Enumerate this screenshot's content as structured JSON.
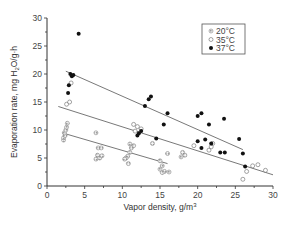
{
  "chart_data": {
    "type": "scatter",
    "title": "",
    "xlabel": "Vapor density, g/m³",
    "ylabel": "Evaporation rate, mg H₂O/g·h",
    "xlim": [
      0,
      30
    ],
    "ylim": [
      0,
      30
    ],
    "xticks": [
      0,
      5,
      10,
      15,
      20,
      25,
      30
    ],
    "yticks": [
      0,
      5,
      10,
      15,
      20,
      25,
      30
    ],
    "grid": false,
    "legend_position": "upper right",
    "series": [
      {
        "name": "20°C",
        "marker": "dotted-circle",
        "points": [
          [
            2.2,
            8.2
          ],
          [
            2.2,
            8.6
          ],
          [
            2.4,
            9
          ],
          [
            2.3,
            9.5
          ],
          [
            2.5,
            10
          ],
          [
            2.6,
            10.5
          ],
          [
            2.7,
            11.2
          ],
          [
            6.5,
            9.5
          ],
          [
            6.8,
            6.8
          ],
          [
            7.2,
            6.8
          ],
          [
            6.7,
            5.5
          ],
          [
            7,
            5
          ],
          [
            7.3,
            5.4
          ],
          [
            6.5,
            4.8
          ],
          [
            11,
            7.5
          ],
          [
            11.5,
            7.2
          ],
          [
            11.2,
            6.8
          ],
          [
            11,
            6
          ],
          [
            10.7,
            5.3
          ],
          [
            10.5,
            5
          ],
          [
            10.3,
            4.8
          ],
          [
            10.8,
            4
          ],
          [
            15,
            4.5
          ],
          [
            15.3,
            3.6
          ],
          [
            15,
            3
          ],
          [
            15.6,
            2.6
          ],
          [
            16.2,
            2.5
          ],
          [
            15.3,
            2.4
          ],
          [
            18,
            6
          ],
          [
            18.3,
            5.5
          ],
          [
            17.8,
            5.2
          ],
          [
            14,
            7.6
          ],
          [
            16,
            5.8
          ]
        ],
        "regression": [
          [
            2,
            9.5
          ],
          [
            16,
            4
          ]
        ]
      },
      {
        "name": "35°C",
        "marker": "open-circle",
        "points": [
          [
            2.6,
            14.6
          ],
          [
            3,
            15
          ],
          [
            3.2,
            18.4
          ],
          [
            11.5,
            11
          ],
          [
            12,
            10.6
          ],
          [
            11.7,
            9.8
          ],
          [
            12.5,
            10.2
          ],
          [
            19.5,
            7.2
          ],
          [
            21.5,
            6.4
          ],
          [
            21.8,
            7
          ],
          [
            22,
            7.6
          ],
          [
            26,
            1.2
          ],
          [
            26.5,
            2.6
          ],
          [
            27.3,
            3.6
          ],
          [
            28,
            3.8
          ],
          [
            29,
            2.8
          ]
        ],
        "regression": [
          [
            1.5,
            14.2
          ],
          [
            30,
            2
          ]
        ]
      },
      {
        "name": "37°C",
        "marker": "filled-circle",
        "points": [
          [
            4.2,
            27.2
          ],
          [
            3.1,
            20
          ],
          [
            3.3,
            19.6
          ],
          [
            3.5,
            19.8
          ],
          [
            2.9,
            18
          ],
          [
            2.8,
            16.6
          ],
          [
            13.5,
            15.5
          ],
          [
            13.8,
            16
          ],
          [
            13,
            14.3
          ],
          [
            16,
            13
          ],
          [
            15.5,
            11
          ],
          [
            12.5,
            9.8
          ],
          [
            12.2,
            9.4
          ],
          [
            12,
            9
          ],
          [
            14.5,
            8.5
          ],
          [
            20.5,
            13
          ],
          [
            20,
            12.5
          ],
          [
            20,
            8
          ],
          [
            21.5,
            11
          ],
          [
            21,
            8.3
          ],
          [
            21.8,
            7.6
          ],
          [
            20.5,
            6.8
          ],
          [
            23,
            6
          ],
          [
            23.6,
            6
          ],
          [
            23.5,
            12
          ],
          [
            26,
            5.8
          ],
          [
            25.5,
            8.4
          ],
          [
            26.3,
            3.5
          ]
        ],
        "regression": [
          [
            2.5,
            20.5
          ],
          [
            26,
            6.5
          ]
        ]
      }
    ]
  },
  "axes": {
    "xlabel_prefix": "Vapor density, g/m",
    "xlabel_sup": "3",
    "ylabel_a": "Evaporation rate, mg H",
    "ylabel_sub": "2",
    "ylabel_b": "O/g·h",
    "xtick_labels": [
      "0",
      "5",
      "10",
      "15",
      "20",
      "25",
      "30"
    ],
    "ytick_labels": [
      "0",
      "5",
      "10",
      "15",
      "20",
      "25",
      "30"
    ]
  },
  "legend": {
    "items": [
      {
        "label": "20°C"
      },
      {
        "label": "35°C"
      },
      {
        "label": "37°C"
      }
    ]
  }
}
